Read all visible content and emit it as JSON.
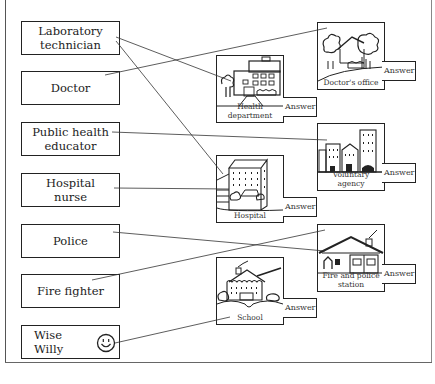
{
  "roles": [
    {
      "id": "laboratory-technician",
      "label": "Laboratory\ntechnician"
    },
    {
      "id": "doctor",
      "label": "Doctor"
    },
    {
      "id": "public-health-educator",
      "label": "Public health\neducator"
    },
    {
      "id": "hospital-nurse",
      "label": "Hospital\nnurse"
    },
    {
      "id": "police",
      "label": "Police"
    },
    {
      "id": "fire-fighter",
      "label": "Fire fighter"
    },
    {
      "id": "wise-willy",
      "label": "Wise\nWilly",
      "icon": "smiley-face-icon"
    }
  ],
  "places": [
    {
      "id": "health-department",
      "caption": "Health\ndepartment",
      "answer_label": "Answer",
      "icon": "health-department-building-icon"
    },
    {
      "id": "doctors-office",
      "caption": "Doctor's office",
      "answer_label": "Answer",
      "icon": "doctors-office-building-icon"
    },
    {
      "id": "hospital",
      "caption": "Hospital",
      "answer_label": "Answer",
      "icon": "hospital-building-icon"
    },
    {
      "id": "voluntary-agency",
      "caption": "Voluntary\nagency",
      "answer_label": "Answer",
      "icon": "voluntary-agency-buildings-icon"
    },
    {
      "id": "fire-and-police-station",
      "caption": "Fire and police\nstation",
      "answer_label": "Answer",
      "icon": "fire-police-station-icon"
    },
    {
      "id": "school",
      "caption": "School",
      "answer_label": "Answer",
      "icon": "school-building-icon"
    }
  ],
  "connections": [
    {
      "from": "laboratory-technician",
      "to": "health-department"
    },
    {
      "from": "laboratory-technician",
      "to": "hospital"
    },
    {
      "from": "doctor",
      "to": "doctors-office"
    },
    {
      "from": "public-health-educator",
      "to": "voluntary-agency"
    },
    {
      "from": "hospital-nurse",
      "to": "hospital"
    },
    {
      "from": "police",
      "to": "fire-and-police-station"
    },
    {
      "from": "fire-fighter",
      "to": "fire-and-police-station"
    },
    {
      "from": "wise-willy",
      "to": "school"
    }
  ]
}
